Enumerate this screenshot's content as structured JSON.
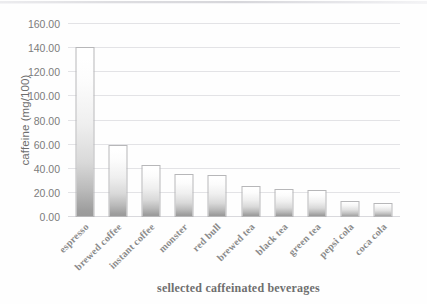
{
  "chart_data": {
    "type": "bar",
    "title": "",
    "xlabel": "sellected caffeinated beverages",
    "ylabel": "caffeine (mg/100)",
    "categories": [
      "espresso",
      "brewed coffee",
      "instant coffee",
      "monster",
      "red bull",
      "brewed tea",
      "black tea",
      "green tea",
      "pepsi cola",
      "coca cola"
    ],
    "values": [
      141,
      60,
      43,
      36,
      35,
      26,
      23,
      22,
      13,
      12
    ],
    "ylim": [
      0,
      160
    ],
    "ytick_step": 20,
    "ytick_labels": [
      "0.00",
      "20.00",
      "40.00",
      "60.00",
      "80.00",
      "100.00",
      "120.00",
      "140.00",
      "160.00"
    ],
    "ytick_values": [
      0,
      20,
      40,
      60,
      80,
      100,
      120,
      140,
      160
    ],
    "grid": true,
    "grid_axis": "y",
    "legend": false,
    "legend_position": "none",
    "bar_fill": "#d9d9d9",
    "bar_border": "#b7b7b9",
    "gridline_color": "#e3e3e6",
    "text_color": "#7c7c7c",
    "background": "#ffffff",
    "series": [
      {
        "name": "caffeine (mg/100)",
        "values": [
          141,
          60,
          43,
          36,
          35,
          26,
          23,
          22,
          13,
          12
        ]
      }
    ]
  }
}
